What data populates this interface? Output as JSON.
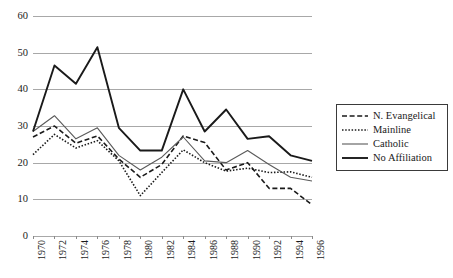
{
  "chart_data": {
    "type": "line",
    "title": "",
    "subtitle": "",
    "xlabel": "",
    "ylabel": "",
    "categories": [
      "1970",
      "1972",
      "1974",
      "1976",
      "1978",
      "1980",
      "1982",
      "1984",
      "1986",
      "1988",
      "1990",
      "1992",
      "1994",
      "1996"
    ],
    "x": [
      1970,
      1972,
      1974,
      1976,
      1978,
      1980,
      1982,
      1984,
      1986,
      1988,
      1990,
      1992,
      1994,
      1996
    ],
    "ylim": [
      0,
      60
    ],
    "yticks": [
      0,
      10,
      20,
      30,
      40,
      50,
      60
    ],
    "ytick_labels": [
      "0",
      "10",
      "20",
      "30",
      "40",
      "50",
      "60"
    ],
    "xtick_labels": [
      "1970",
      "1972",
      "1974",
      "1976",
      "1978",
      "1980",
      "1982",
      "1984",
      "1986",
      "1988",
      "1990",
      "1992",
      "1994",
      "1996"
    ],
    "grid": true,
    "grid_axis": "y",
    "legend_position": "right",
    "series": [
      {
        "name": "N. Evangelical",
        "style": "dashed",
        "color": "#1a1a1a",
        "width": 1.6,
        "values": [
          27.0,
          30.0,
          25.3,
          27.3,
          21.0,
          16.0,
          19.5,
          27.3,
          25.5,
          18.0,
          20.0,
          13.0,
          13.0,
          8.5
        ]
      },
      {
        "name": "Mainline",
        "style": "dotted",
        "color": "#1a1a1a",
        "width": 1.6,
        "values": [
          22.2,
          27.7,
          24.0,
          26.0,
          20.5,
          11.0,
          17.3,
          23.5,
          20.0,
          17.7,
          18.5,
          17.3,
          17.5,
          16.0
        ]
      },
      {
        "name": "Catholic",
        "style": "solid-thin",
        "color": "#5a5a5a",
        "width": 1.1,
        "values": [
          28.5,
          32.8,
          26.5,
          29.5,
          22.0,
          18.0,
          21.5,
          27.0,
          20.5,
          20.0,
          23.3,
          19.5,
          16.0,
          15.0
        ]
      },
      {
        "name": "No Affiliation",
        "style": "solid-thick",
        "color": "#1a1a1a",
        "width": 1.9,
        "values": [
          28.5,
          46.5,
          41.5,
          51.5,
          29.5,
          23.3,
          23.3,
          40.0,
          28.5,
          34.5,
          26.5,
          27.2,
          22.0,
          20.5
        ]
      }
    ]
  },
  "legend": {
    "entries": [
      {
        "label": "N. Evangelical",
        "swatch": "dashed-line-icon"
      },
      {
        "label": "Mainline",
        "swatch": "dotted-line-icon"
      },
      {
        "label": "Catholic",
        "swatch": "thin-solid-line-icon"
      },
      {
        "label": "No Affiliation",
        "swatch": "thick-solid-line-icon"
      }
    ]
  },
  "colors": {
    "grid": "#a8a8a8",
    "text": "#1a1a1a",
    "catholic": "#5a5a5a",
    "background": "#ffffff"
  }
}
